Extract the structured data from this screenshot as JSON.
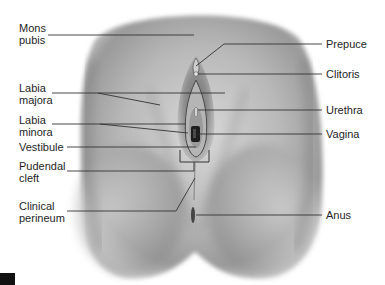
{
  "diagram": {
    "left_labels": [
      {
        "id": "mons-pubis",
        "text": "Mons\npubis"
      },
      {
        "id": "labia-majora",
        "text": "Labia\nmajora"
      },
      {
        "id": "labia-minora",
        "text": "Labia\nminora"
      },
      {
        "id": "vestibule",
        "text": "Vestibule"
      },
      {
        "id": "pudendal-cleft",
        "text": "Pudendal\ncleft"
      },
      {
        "id": "clinical-perineum",
        "text": "Clinical\nperineum"
      }
    ],
    "right_labels": [
      {
        "id": "prepuce",
        "text": "Prepuce"
      },
      {
        "id": "clitoris",
        "text": "Clitoris"
      },
      {
        "id": "urethra",
        "text": "Urethra"
      },
      {
        "id": "vagina",
        "text": "Vagina"
      },
      {
        "id": "anus",
        "text": "Anus"
      }
    ],
    "colors": {
      "background": "#ffffff",
      "skin_light": "#d4d4d4",
      "skin_mid": "#a9a9a9",
      "skin_dark": "#6e6e6e",
      "leader_line": "#333333",
      "text": "#1e1e1e"
    }
  }
}
